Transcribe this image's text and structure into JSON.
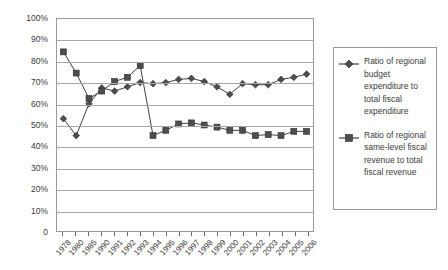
{
  "chart_data": {
    "type": "line",
    "title": "",
    "subtitle": "",
    "xlabel": "",
    "ylabel": "",
    "grid": true,
    "legend_position": "right",
    "ylim": [
      0,
      100
    ],
    "ytick_labels": [
      "100%",
      "90%",
      "80%",
      "70%",
      "60%",
      "50%",
      "40%",
      "30%",
      "20%",
      "10%",
      "0"
    ],
    "ytick_values": [
      100,
      90,
      80,
      70,
      60,
      50,
      40,
      30,
      20,
      10,
      0
    ],
    "categories": [
      "1978",
      "1980",
      "1985",
      "1990",
      "1991",
      "1992",
      "1993",
      "1994",
      "1995",
      "1996",
      "1997",
      "1998",
      "1999",
      "2000",
      "2001",
      "2002",
      "2003",
      "2004",
      "2005",
      "2006"
    ],
    "series": [
      {
        "name": "Ratio of regional budget expenditure to total fiscal expenditure",
        "marker": "diamond",
        "color": "#4d4d4d",
        "values": [
          53.0,
          45.0,
          60.0,
          67.5,
          66.0,
          68.0,
          70.0,
          69.5,
          70.0,
          71.5,
          72.0,
          70.5,
          68.0,
          64.5,
          69.5,
          69.0,
          69.0,
          71.5,
          72.5,
          74.0
        ]
      },
      {
        "name": "Ratio of regional same-level fiscal revenue to total fiscal revenue",
        "marker": "square",
        "color": "#4d4d4d",
        "values": [
          84.5,
          74.5,
          62.5,
          66.0,
          70.5,
          72.5,
          78.0,
          45.0,
          47.5,
          50.5,
          51.0,
          50.0,
          49.0,
          47.5,
          47.5,
          45.0,
          45.5,
          45.0,
          47.0,
          47.0
        ]
      }
    ]
  },
  "legend": {
    "entries": [
      {
        "marker": "diamond-marker-icon",
        "label": "Ratio of regional budget expenditure to total fiscal expenditure"
      },
      {
        "marker": "square-marker-icon",
        "label": "Ratio of regional same-level fiscal revenue to total fiscal revenue"
      }
    ]
  }
}
